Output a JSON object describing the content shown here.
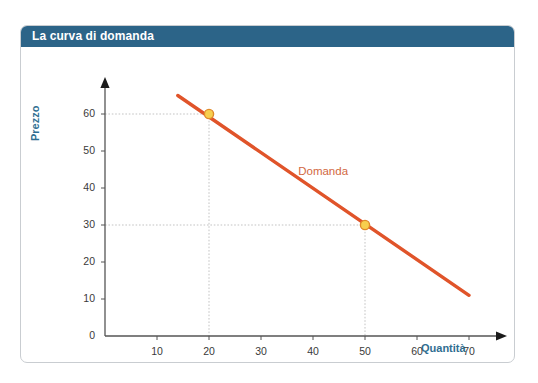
{
  "card": {
    "title": "La curva di domanda",
    "title_bar_color": "#2c6488",
    "border_color": "#c9cdd1",
    "background_color": "#ffffff"
  },
  "chart_data": {
    "type": "line",
    "title": "La curva di domanda",
    "xlabel": "Quantità",
    "ylabel": "Prezzo",
    "xlim": [
      0,
      78
    ],
    "ylim": [
      0,
      66
    ],
    "grid": false,
    "legend_position": "inline-right",
    "series": [
      {
        "name": "Domanda",
        "color": "#e0542a",
        "x": [
          14,
          70
        ],
        "y": [
          65,
          11
        ]
      }
    ],
    "points": [
      {
        "x": 20,
        "y": 60,
        "fill": "#f7cf4e",
        "stroke": "#e08a2a"
      },
      {
        "x": 50,
        "y": 30,
        "fill": "#f7cf4e",
        "stroke": "#e08a2a"
      }
    ],
    "guide_lines": [
      {
        "from": [
          0,
          60
        ],
        "to": [
          20,
          60
        ]
      },
      {
        "from": [
          20,
          60
        ],
        "to": [
          20,
          0
        ]
      },
      {
        "from": [
          0,
          30
        ],
        "to": [
          50,
          30
        ]
      },
      {
        "from": [
          50,
          30
        ],
        "to": [
          50,
          0
        ]
      }
    ],
    "xticks": [
      10,
      20,
      30,
      40,
      50,
      60,
      70
    ],
    "xtick_labels": [
      "10",
      "20",
      "30",
      "40",
      "50",
      "60",
      "70"
    ],
    "yticks": [
      0,
      10,
      20,
      30,
      40,
      50,
      60
    ],
    "ytick_labels": [
      "0",
      "10",
      "20",
      "30",
      "40",
      "50",
      "60"
    ],
    "annotations": [
      {
        "text": "Domanda",
        "x": 41,
        "y": 44,
        "color": "#d2683f"
      }
    ],
    "axis_color": "#555555",
    "guide_color": "#c3c3c3",
    "label_color": "#2f6e91"
  }
}
